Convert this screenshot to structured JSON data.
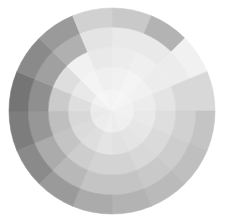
{
  "page": {
    "background_color": "#ffffff",
    "width": 225,
    "height": 222
  },
  "chart_data": {
    "type": "heatmap",
    "subtype": "polar-sector-heatmap",
    "title": "",
    "subtitle": "",
    "xlabel": "",
    "ylabel": "",
    "legend": "none",
    "grid": false,
    "axes_visible": false,
    "tick_labels": [],
    "annotations": [],
    "colormap": "greys",
    "color_scale": {
      "min_value": 0,
      "max_value": 100,
      "min_color": "#f7f7f7",
      "max_color": "#6e6e6e"
    },
    "geometry": {
      "center_x": 112,
      "center_y": 111,
      "outer_radius": 103,
      "inner_radius": 0,
      "n_sectors": 16,
      "n_rings": 5,
      "sector_angle_deg": 22.5,
      "start_angle_deg": -90,
      "direction": "clockwise",
      "ring_radii": [
        22,
        44,
        64,
        84,
        103
      ]
    },
    "sector_labels": [
      "S1",
      "S2",
      "S3",
      "S4",
      "S5",
      "S6",
      "S7",
      "S8",
      "S9",
      "S10",
      "S11",
      "S12",
      "S13",
      "S14",
      "S15",
      "S16"
    ],
    "ring_labels": [
      "R1",
      "R2",
      "R3",
      "R4",
      "R5"
    ],
    "values": [
      [
        96,
        95,
        93,
        92,
        91
      ],
      [
        97,
        96,
        94,
        92,
        90
      ],
      [
        96,
        95,
        93,
        90,
        86
      ],
      [
        95,
        93,
        90,
        86,
        82
      ],
      [
        95,
        92,
        88,
        84,
        80
      ],
      [
        94,
        91,
        87,
        83,
        79
      ],
      [
        94,
        90,
        86,
        82,
        78
      ],
      [
        93,
        89,
        85,
        80,
        76
      ],
      [
        94,
        90,
        85,
        80,
        74
      ],
      [
        93,
        88,
        83,
        77,
        70
      ],
      [
        93,
        87,
        80,
        73,
        64
      ],
      [
        92,
        86,
        78,
        70,
        60
      ],
      [
        93,
        88,
        82,
        74,
        66
      ],
      [
        95,
        92,
        88,
        84,
        80
      ],
      [
        97,
        96,
        95,
        94,
        93
      ],
      [
        96,
        94,
        92,
        90,
        89
      ]
    ],
    "cell_colors": [
      [
        "#f4f4f4",
        "#f1f1f1",
        "#ececec",
        "#e9e9e9",
        "#e6e6e6"
      ],
      [
        "#f6f6f6",
        "#f4f4f4",
        "#efefef",
        "#e9e9e9",
        "#e4e4e4"
      ],
      [
        "#f4f4f4",
        "#f1f1f1",
        "#ececec",
        "#e4e4e4",
        "#d8d8d8"
      ],
      [
        "#f1f1f1",
        "#ececec",
        "#e4e4e4",
        "#d8d8d8",
        "#cbcbcb"
      ],
      [
        "#f1f1f1",
        "#e9e9e9",
        "#dedede",
        "#d1d1d1",
        "#c4c4c4"
      ],
      [
        "#efefef",
        "#e6e6e6",
        "#dadada",
        "#cdcdcd",
        "#bfbfbf"
      ],
      [
        "#efefef",
        "#e4e4e4",
        "#d8d8d8",
        "#c9c9c9",
        "#bababa"
      ],
      [
        "#ececec",
        "#e1e1e1",
        "#d3d3d3",
        "#c4c4c4",
        "#b3b3b3"
      ],
      [
        "#efefef",
        "#e4e4e4",
        "#d3d3d3",
        "#c4c4c4",
        "#ababab"
      ],
      [
        "#ececec",
        "#dedede",
        "#cdcdcd",
        "#b8b8b8",
        "#9d9d9d"
      ],
      [
        "#ececec",
        "#dbdbdb",
        "#c4c4c4",
        "#ababab",
        "#8d8d8d"
      ],
      [
        "#e9e9e9",
        "#d8d8d8",
        "#bfbfbf",
        "#a3a3a3",
        "#858585"
      ],
      [
        "#ececec",
        "#dedede",
        "#cbcbcb",
        "#b3b3b3",
        "#999999"
      ],
      [
        "#f1f1f1",
        "#e9e9e9",
        "#dedede",
        "#d1d1d1",
        "#c4c4c4"
      ],
      [
        "#f6f6f6",
        "#f4f4f4",
        "#f1f1f1",
        "#efefef",
        "#ececec"
      ],
      [
        "#f4f4f4",
        "#efefef",
        "#e9e9e9",
        "#e4e4e4",
        "#e1e1e1"
      ]
    ],
    "overrides": [
      {
        "sector": 11,
        "ring": 4,
        "color": "#7d7d7d"
      },
      {
        "sector": 12,
        "ring": 4,
        "color": "#757575"
      },
      {
        "sector": 12,
        "ring": 3,
        "color": "#8f8f8f"
      },
      {
        "sector": 11,
        "ring": 3,
        "color": "#979797"
      },
      {
        "sector": 13,
        "ring": 4,
        "color": "#8a8a8a"
      },
      {
        "sector": 13,
        "ring": 3,
        "color": "#a0a0a0"
      },
      {
        "sector": 14,
        "ring": 4,
        "color": "#9a9a9a"
      },
      {
        "sector": 10,
        "ring": 4,
        "color": "#8a8a8a"
      },
      {
        "sector": 9,
        "ring": 4,
        "color": "#9a9a9a"
      },
      {
        "sector": 0,
        "ring": 4,
        "color": "#c9c9c9"
      },
      {
        "sector": 1,
        "ring": 4,
        "color": "#b3b3b3"
      },
      {
        "sector": 15,
        "ring": 4,
        "color": "#d1d1d1"
      },
      {
        "sector": 14,
        "ring": 3,
        "color": "#b0b0b0"
      },
      {
        "sector": 2,
        "ring": 4,
        "color": "#f1f1f1"
      },
      {
        "sector": 3,
        "ring": 4,
        "color": "#d8d8d8"
      },
      {
        "sector": 2,
        "ring": 3,
        "color": "#ececec"
      }
    ]
  }
}
